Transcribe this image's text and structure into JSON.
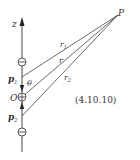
{
  "diagram": {
    "axis_label": "z",
    "point_label": "P",
    "origin_label": "O",
    "dipole_top_label": "p",
    "dipole_top_sub": "1",
    "dipole_bottom_label": "p",
    "dipole_bottom_sub": "2",
    "distance_labels": {
      "r1": "r",
      "r1_sub": "1",
      "r": "r",
      "r2": "r",
      "r2_sub": "2"
    },
    "angle_label": "θ",
    "equation_number": "(4.10.10)",
    "charges": {
      "top": "negative",
      "center": "positive",
      "bottom": "negative"
    },
    "colors": {
      "line": "#444444",
      "text": "#333333"
    }
  }
}
